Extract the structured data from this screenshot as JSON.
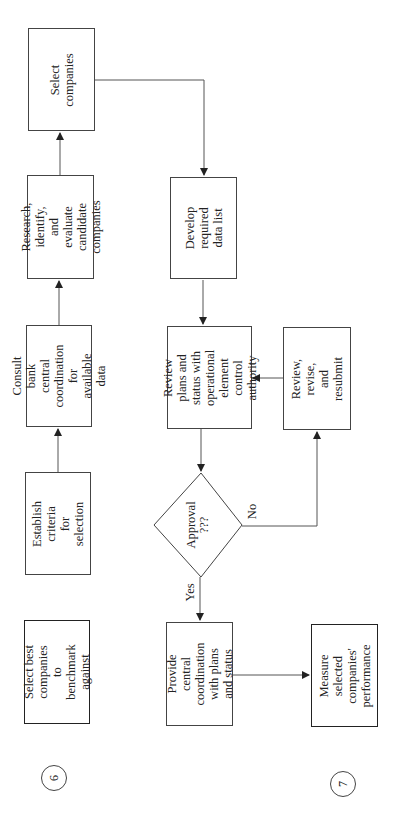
{
  "diagram": {
    "orientation": "rotated -90 degrees (text reads bottom-to-top)",
    "step_markers": [
      {
        "id": "step6",
        "label": "6"
      },
      {
        "id": "step7",
        "label": "7"
      }
    ],
    "nodes": {
      "select_companies": {
        "label": "Select\ncompanies",
        "shape": "rect"
      },
      "research": {
        "label": "Research, identify,\nand evaluate\ncandidate\ncompanies",
        "shape": "rect"
      },
      "develop": {
        "label": "Develop\nrequired\ndata list",
        "shape": "rect"
      },
      "consult": {
        "label": "Consult bank\ncentral\ncoordination for\navailable data",
        "shape": "rect"
      },
      "review_plans": {
        "label": "Review plans and\nstatus with\noperational\nelement control\nauthority",
        "shape": "rect"
      },
      "review_revise": {
        "label": "Review,\nrevise, and\nresubmit",
        "shape": "rect"
      },
      "establish": {
        "label": "Establish\ncriteria for\nselection",
        "shape": "rect"
      },
      "approval": {
        "label": "Approval\n???",
        "shape": "diamond"
      },
      "provide": {
        "label": "Provide central\ncoordination\nwith plans\nand status",
        "shape": "rect"
      },
      "select_best": {
        "label": "Select best\ncompanies to\nbenchmark\nagainst",
        "shape": "rect-bold"
      },
      "measure": {
        "label": "Measure\nselected\ncompanies'\nperformance",
        "shape": "rect-bold"
      }
    },
    "edge_labels": {
      "yes": "Yes",
      "no": "No"
    },
    "edges": [
      {
        "from": "establish",
        "to": "consult"
      },
      {
        "from": "consult",
        "to": "research"
      },
      {
        "from": "research",
        "to": "select_companies"
      },
      {
        "from": "select_companies",
        "to": "develop"
      },
      {
        "from": "develop",
        "to": "review_plans"
      },
      {
        "from": "review_plans",
        "to": "approval"
      },
      {
        "from": "approval",
        "to": "provide",
        "label": "Yes"
      },
      {
        "from": "approval",
        "to": "review_revise",
        "label": "No"
      },
      {
        "from": "review_revise",
        "to": "review_plans"
      },
      {
        "from": "provide",
        "to": "measure"
      }
    ],
    "colors": {
      "line": "#444444",
      "background": "#ffffff",
      "text": "#222222"
    }
  }
}
